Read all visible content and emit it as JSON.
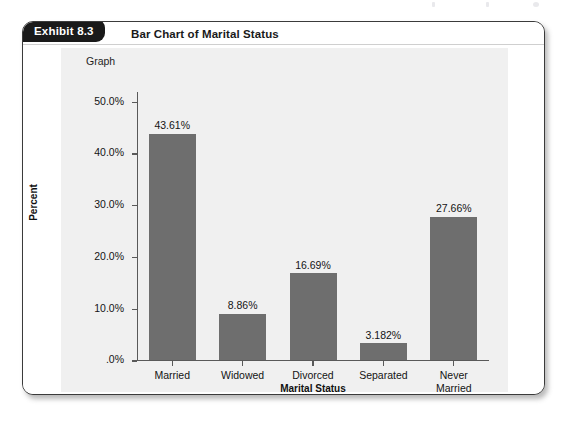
{
  "exhibit": {
    "tab_label": "Exhibit 8.3",
    "title": "Bar Chart of Marital Status"
  },
  "chart_data": {
    "type": "bar",
    "title": "Graph",
    "xlabel": "Marital Status",
    "ylabel": "Percent",
    "categories": [
      "Married",
      "Widowed",
      "Divorced",
      "Separated",
      "Never\nMarried"
    ],
    "values": [
      43.61,
      8.86,
      16.69,
      3.182,
      27.66
    ],
    "value_labels": [
      "43.61%",
      "8.86%",
      "16.69%",
      "3.182%",
      "27.66%"
    ],
    "ytick_labels": [
      ".0%",
      "10.0%",
      "20.0%",
      "30.0%",
      "40.0%",
      "50.0%"
    ],
    "ytick_values": [
      0,
      10,
      20,
      30,
      40,
      50
    ],
    "ylim": [
      0,
      52
    ],
    "grid": false,
    "legend": false,
    "bar_color": "#6e6e6e",
    "panel_color": "#f0f0f0",
    "axis_color": "#595959"
  }
}
